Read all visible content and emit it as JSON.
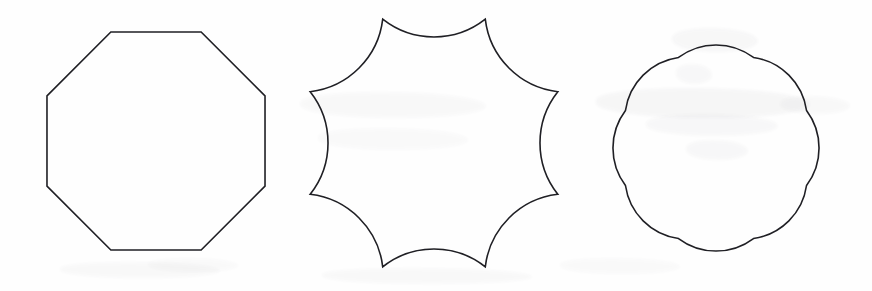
{
  "plate": {
    "background_color": "#fefefe",
    "stroke_color": "#1f1f24",
    "stroke_width": 1.6,
    "width": 872,
    "height": 291,
    "description": "Three outlined geometric figures in a row on a scanned white page"
  },
  "figures": [
    {
      "id": "octagon",
      "name": "regular-octagon",
      "kind": "polygon",
      "edge_style": "straight",
      "sides": 8,
      "center": {
        "x": 156,
        "y": 141
      },
      "circumradius": 118,
      "rotation_deg": 22.5,
      "bounds": {
        "left": 44,
        "top": 33,
        "right": 268,
        "bottom": 250
      },
      "vertices": [
        {
          "x": 265.0,
          "y": 96.1
        },
        {
          "x": 201.4,
          "y": 32.5
        },
        {
          "x": 110.6,
          "y": 32.5
        },
        {
          "x": 47.0,
          "y": 96.1
        },
        {
          "x": 47.0,
          "y": 186.9
        },
        {
          "x": 110.6,
          "y": 250.5
        },
        {
          "x": 201.4,
          "y": 250.5
        },
        {
          "x": 265.0,
          "y": 186.9
        }
      ]
    },
    {
      "id": "star",
      "name": "eight-point-concave-star",
      "kind": "arc-polygon",
      "edge_style": "concave-arc",
      "sides": 8,
      "arc_sweep": 0,
      "arc_radius_factor": 0.62,
      "center": {
        "x": 434,
        "y": 143
      },
      "circumradius": 134,
      "rotation_deg": 22.5,
      "bounds": {
        "left": 300,
        "top": 16,
        "right": 568,
        "bottom": 270
      },
      "vertices": [
        {
          "x": 567.8,
          "y": 91.7
        },
        {
          "x": 506.2,
          "y": 30.2
        },
        {
          "x": 361.8,
          "y": 30.2
        },
        {
          "x": 300.2,
          "y": 91.7
        },
        {
          "x": 300.2,
          "y": 194.3
        },
        {
          "x": 361.8,
          "y": 255.8
        },
        {
          "x": 506.2,
          "y": 255.8
        },
        {
          "x": 567.8,
          "y": 194.3
        }
      ]
    },
    {
      "id": "flower",
      "name": "eight-lobe-flower-cloud",
      "kind": "arc-polygon",
      "edge_style": "convex-arc",
      "sides": 8,
      "arc_sweep": 1,
      "arc_radius_factor": 0.6,
      "center": {
        "x": 716,
        "y": 148
      },
      "circumradius": 98,
      "rotation_deg": 22.5,
      "bounds": {
        "left": 589,
        "top": 22,
        "right": 843,
        "bottom": 275
      },
      "vertices": [
        {
          "x": 806.3,
          "y": 110.4
        },
        {
          "x": 753.6,
          "y": 57.7
        },
        {
          "x": 678.4,
          "y": 57.7
        },
        {
          "x": 625.7,
          "y": 110.4
        },
        {
          "x": 625.7,
          "y": 185.6
        },
        {
          "x": 678.4,
          "y": 185.6
        },
        {
          "x": 753.6,
          "y": 185.6
        },
        {
          "x": 806.3,
          "y": 185.6
        }
      ]
    }
  ]
}
